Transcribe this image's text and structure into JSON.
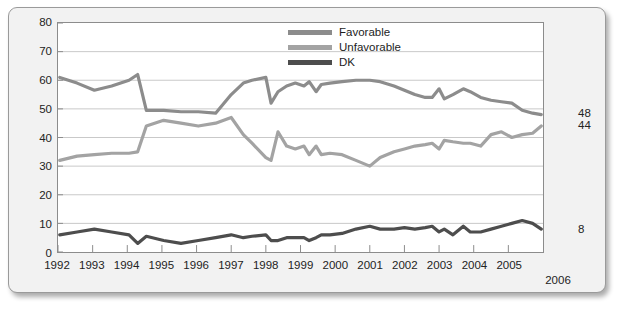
{
  "chart_data": {
    "type": "line",
    "title": "",
    "subtitle": "",
    "xlabel": "",
    "ylabel": "",
    "xlim": [
      1992,
      2006
    ],
    "ylim": [
      0,
      80
    ],
    "ytick_step": 10,
    "yticks": [
      0,
      10,
      20,
      30,
      40,
      50,
      60,
      70,
      80
    ],
    "xticks": [
      1992,
      1993,
      1994,
      1995,
      1996,
      1997,
      1998,
      1999,
      2000,
      2001,
      2002,
      2003,
      2004,
      2005
    ],
    "xtick_extra": "2006",
    "grid": true,
    "grid_axis": "y",
    "legend_position": "top-center",
    "end_labels": [
      {
        "series": "Favorable",
        "value": 48,
        "text": "48"
      },
      {
        "series": "Unfavorable",
        "value": 44,
        "text": "44"
      },
      {
        "series": "DK",
        "value": 8,
        "text": "8"
      }
    ],
    "colors": {
      "favorable": "#8c8c8c",
      "unfavorable": "#a3a3a3",
      "dk": "#4d4d4d",
      "grid": "#c9c9c9",
      "axis": "#8c8c8c",
      "plot_background": "#ffffff",
      "frame_background": "#f2f2f2",
      "frame_border": "#9a9a9a",
      "text": "#232323"
    },
    "series": [
      {
        "name": "Favorable",
        "color": "#8c8c8c",
        "points": [
          [
            1992.05,
            61
          ],
          [
            1992.55,
            59
          ],
          [
            1993.05,
            56.5
          ],
          [
            1993.55,
            58
          ],
          [
            1994.05,
            60
          ],
          [
            1994.3,
            62
          ],
          [
            1994.55,
            49.5
          ],
          [
            1995.05,
            49.5
          ],
          [
            1995.55,
            49
          ],
          [
            1996.05,
            49
          ],
          [
            1996.55,
            48.5
          ],
          [
            1997.0,
            55
          ],
          [
            1997.35,
            59
          ],
          [
            1997.6,
            60
          ],
          [
            1998.0,
            61
          ],
          [
            1998.15,
            52
          ],
          [
            1998.35,
            56
          ],
          [
            1998.6,
            58
          ],
          [
            1998.85,
            59
          ],
          [
            1999.1,
            58
          ],
          [
            1999.25,
            59.5
          ],
          [
            1999.45,
            56
          ],
          [
            1999.6,
            58.5
          ],
          [
            1999.85,
            59
          ],
          [
            2000.2,
            59.5
          ],
          [
            2000.6,
            60
          ],
          [
            2001.0,
            60
          ],
          [
            2001.3,
            59.5
          ],
          [
            2001.7,
            58
          ],
          [
            2002.0,
            56.5
          ],
          [
            2002.3,
            55
          ],
          [
            2002.6,
            54
          ],
          [
            2002.8,
            54
          ],
          [
            2003.0,
            57
          ],
          [
            2003.15,
            53.5
          ],
          [
            2003.4,
            55
          ],
          [
            2003.7,
            57
          ],
          [
            2003.9,
            56
          ],
          [
            2004.2,
            54
          ],
          [
            2004.5,
            53
          ],
          [
            2004.8,
            52.5
          ],
          [
            2005.1,
            52
          ],
          [
            2005.4,
            49.5
          ],
          [
            2005.7,
            48.5
          ],
          [
            2005.95,
            48
          ]
        ]
      },
      {
        "name": "Unfavorable",
        "color": "#a3a3a3",
        "points": [
          [
            1992.05,
            32
          ],
          [
            1992.55,
            33.5
          ],
          [
            1993.05,
            34
          ],
          [
            1993.55,
            34.5
          ],
          [
            1994.05,
            34.5
          ],
          [
            1994.3,
            35
          ],
          [
            1994.55,
            44
          ],
          [
            1995.05,
            46
          ],
          [
            1995.55,
            45
          ],
          [
            1996.05,
            44
          ],
          [
            1996.55,
            45
          ],
          [
            1997.0,
            47
          ],
          [
            1997.35,
            41
          ],
          [
            1997.6,
            38
          ],
          [
            1998.0,
            33
          ],
          [
            1998.15,
            32
          ],
          [
            1998.35,
            42
          ],
          [
            1998.6,
            37
          ],
          [
            1998.85,
            36
          ],
          [
            1999.1,
            37
          ],
          [
            1999.25,
            34
          ],
          [
            1999.45,
            37
          ],
          [
            1999.6,
            34
          ],
          [
            1999.85,
            34.5
          ],
          [
            2000.2,
            34
          ],
          [
            2000.6,
            32
          ],
          [
            2001.0,
            30
          ],
          [
            2001.3,
            33
          ],
          [
            2001.7,
            35
          ],
          [
            2002.0,
            36
          ],
          [
            2002.3,
            37
          ],
          [
            2002.6,
            37.5
          ],
          [
            2002.8,
            38
          ],
          [
            2003.0,
            36
          ],
          [
            2003.15,
            39
          ],
          [
            2003.4,
            38.5
          ],
          [
            2003.7,
            38
          ],
          [
            2003.9,
            38
          ],
          [
            2004.2,
            37
          ],
          [
            2004.5,
            41
          ],
          [
            2004.8,
            42
          ],
          [
            2005.1,
            40
          ],
          [
            2005.4,
            41
          ],
          [
            2005.7,
            41.5
          ],
          [
            2005.95,
            44
          ]
        ]
      },
      {
        "name": "DK",
        "color": "#4d4d4d",
        "points": [
          [
            1992.05,
            6
          ],
          [
            1992.55,
            7
          ],
          [
            1993.05,
            8
          ],
          [
            1993.55,
            7
          ],
          [
            1994.05,
            6
          ],
          [
            1994.3,
            3
          ],
          [
            1994.55,
            5.5
          ],
          [
            1995.05,
            4
          ],
          [
            1995.55,
            3
          ],
          [
            1996.05,
            4
          ],
          [
            1996.55,
            5
          ],
          [
            1997.0,
            6
          ],
          [
            1997.35,
            5
          ],
          [
            1997.6,
            5.5
          ],
          [
            1998.0,
            6
          ],
          [
            1998.15,
            4
          ],
          [
            1998.35,
            4
          ],
          [
            1998.6,
            5
          ],
          [
            1998.85,
            5
          ],
          [
            1999.1,
            5
          ],
          [
            1999.25,
            4
          ],
          [
            1999.45,
            5
          ],
          [
            1999.6,
            6
          ],
          [
            1999.85,
            6
          ],
          [
            2000.2,
            6.5
          ],
          [
            2000.6,
            8
          ],
          [
            2001.0,
            9
          ],
          [
            2001.3,
            8
          ],
          [
            2001.7,
            8
          ],
          [
            2002.0,
            8.5
          ],
          [
            2002.3,
            8
          ],
          [
            2002.6,
            8.5
          ],
          [
            2002.8,
            9
          ],
          [
            2003.0,
            7
          ],
          [
            2003.15,
            8
          ],
          [
            2003.4,
            6
          ],
          [
            2003.7,
            9
          ],
          [
            2003.9,
            7
          ],
          [
            2004.2,
            7
          ],
          [
            2004.5,
            8
          ],
          [
            2004.8,
            9
          ],
          [
            2005.1,
            10
          ],
          [
            2005.4,
            11
          ],
          [
            2005.7,
            10
          ],
          [
            2005.95,
            8
          ]
        ]
      }
    ]
  },
  "legend": {
    "items": [
      {
        "label": "Favorable",
        "color": "#8c8c8c"
      },
      {
        "label": "Unfavorable",
        "color": "#a3a3a3"
      },
      {
        "label": "DK",
        "color": "#4d4d4d"
      }
    ]
  }
}
